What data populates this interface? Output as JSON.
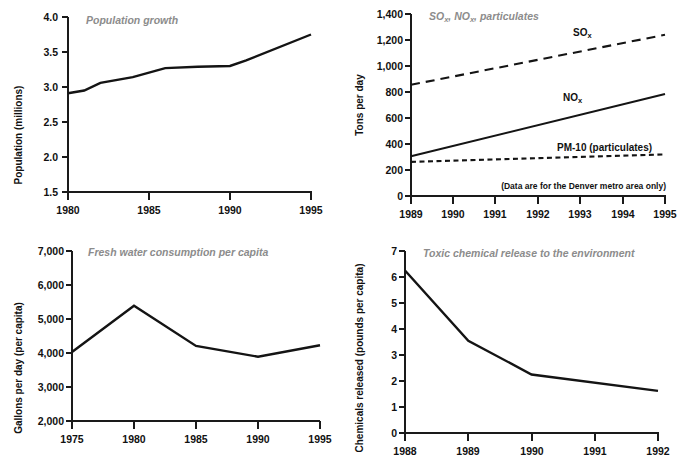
{
  "figure": {
    "background": "#ffffff",
    "line_color": "#141414",
    "title_color": "#8c8c8c",
    "axis_color": "#111111"
  },
  "panels": [
    {
      "id": "population-growth",
      "title": "Population growth",
      "ylabel": "Population (millions)",
      "xlabel": "",
      "xticks": [
        "1980",
        "1985",
        "1990",
        "1995"
      ],
      "yticks": [
        "1.5",
        "2.0",
        "2.5",
        "3.0",
        "3.5",
        "4.0"
      ]
    },
    {
      "id": "emissions",
      "title": "SOx, NOx, particulates",
      "title_parts": [
        "SO",
        "x",
        ", NO",
        "x",
        ", particulates"
      ],
      "ylabel": "Tons per day",
      "xlabel": "",
      "note": "(Data are for the Denver metro area only)",
      "xticks": [
        "1989",
        "1990",
        "1991",
        "1992",
        "1993",
        "1994",
        "1995"
      ],
      "yticks": [
        "0",
        "200",
        "400",
        "600",
        "800",
        "1,000",
        "1,200",
        "1,400"
      ],
      "series_labels": [
        {
          "base": "SO",
          "sub": "x"
        },
        {
          "base": "NO",
          "sub": "x"
        },
        {
          "base": "PM-10 (particulates)",
          "sub": ""
        }
      ]
    },
    {
      "id": "fresh-water",
      "title": "Fresh water consumption per capita",
      "ylabel": "Gallons per day (per capita)",
      "xlabel": "",
      "xticks": [
        "1975",
        "1980",
        "1985",
        "1990",
        "1995"
      ],
      "yticks": [
        "2,000",
        "3,000",
        "4,000",
        "5,000",
        "6,000",
        "7,000"
      ]
    },
    {
      "id": "toxic-release",
      "title": "Toxic chemical release to the environment",
      "ylabel": "Chemicals released (pounds per capita)",
      "xlabel": "",
      "xticks": [
        "1988",
        "1989",
        "1990",
        "1991",
        "1992"
      ],
      "yticks": [
        "0",
        "1",
        "2",
        "3",
        "4",
        "5",
        "6",
        "7"
      ]
    }
  ],
  "chart_data": [
    {
      "type": "line",
      "title": "Population growth",
      "xlabel": "",
      "ylabel": "Population (millions)",
      "xlim": [
        1980,
        1995
      ],
      "ylim": [
        1.5,
        4.0
      ],
      "xticks": [
        1980,
        1985,
        1990,
        1995
      ],
      "yticks": [
        1.5,
        2.0,
        2.5,
        3.0,
        3.5,
        4.0
      ],
      "grid": false,
      "legend": "none",
      "x": [
        1980,
        1981,
        1982,
        1984,
        1986,
        1988,
        1990,
        1991,
        1995
      ],
      "values": [
        2.91,
        2.95,
        3.06,
        3.14,
        3.27,
        3.29,
        3.3,
        3.38,
        3.75
      ]
    },
    {
      "type": "line",
      "title": "SOx, NOx, particulates",
      "xlabel": "",
      "ylabel": "Tons per day",
      "annotation": "(Data are for the Denver metro area only)",
      "xlim": [
        1989,
        1995
      ],
      "ylim": [
        0,
        1400
      ],
      "xticks": [
        1989,
        1990,
        1991,
        1992,
        1993,
        1994,
        1995
      ],
      "yticks": [
        0,
        200,
        400,
        600,
        800,
        1000,
        1200,
        1400
      ],
      "grid": false,
      "legend": "inline-labels",
      "x": [
        1989,
        1995
      ],
      "series": [
        {
          "name": "SOx",
          "style": "long-dash",
          "values": [
            855,
            1240
          ]
        },
        {
          "name": "NOx",
          "style": "solid",
          "values": [
            305,
            785
          ]
        },
        {
          "name": "PM-10 (particulates)",
          "style": "short-dash",
          "values": [
            262,
            320
          ]
        }
      ]
    },
    {
      "type": "line",
      "title": "Fresh water consumption per capita",
      "xlabel": "",
      "ylabel": "Gallons per day (per capita)",
      "xlim": [
        1975,
        1995
      ],
      "ylim": [
        2000,
        7000
      ],
      "xticks": [
        1975,
        1980,
        1985,
        1990,
        1995
      ],
      "yticks": [
        2000,
        3000,
        4000,
        5000,
        6000,
        7000
      ],
      "grid": false,
      "legend": "none",
      "x": [
        1975,
        1980,
        1985,
        1990,
        1995
      ],
      "values": [
        4030,
        5390,
        4210,
        3890,
        4230
      ]
    },
    {
      "type": "line",
      "title": "Toxic chemical release to the environment",
      "xlabel": "",
      "ylabel": "Chemicals released (pounds per capita)",
      "xlim": [
        1988,
        1992
      ],
      "ylim": [
        0,
        7
      ],
      "xticks": [
        1988,
        1989,
        1990,
        1991,
        1992
      ],
      "yticks": [
        0,
        1,
        2,
        3,
        4,
        5,
        6,
        7
      ],
      "grid": false,
      "legend": "none",
      "x": [
        1988,
        1989,
        1990,
        1992
      ],
      "values": [
        6.25,
        3.55,
        2.25,
        1.62
      ]
    }
  ]
}
